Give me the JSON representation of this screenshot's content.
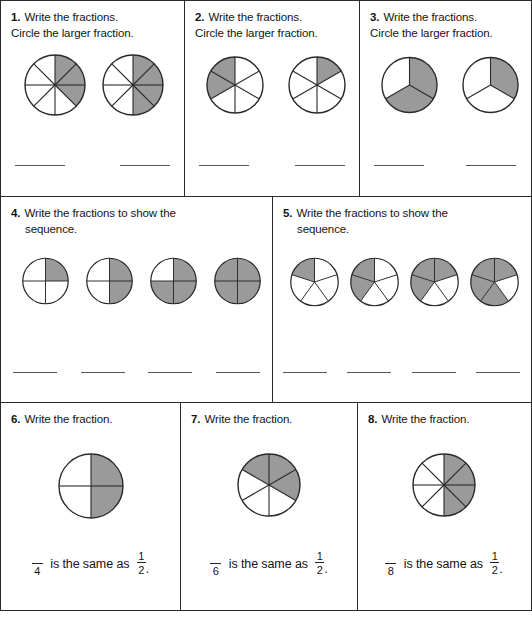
{
  "worksheet": {
    "shade_color": "#9a9a9a",
    "outline_color": "#2a2a2a",
    "line_color": "#555555"
  },
  "problems": [
    {
      "number": "1.",
      "prompt_line1": "Write the fractions.",
      "prompt_line2": "Circle the larger fraction.",
      "figures": [
        {
          "name": "pie-3-of-8",
          "slices": 8,
          "shaded": 3,
          "shaded_indices": [
            0,
            1,
            2
          ],
          "start_angle": -90,
          "radius": 30
        },
        {
          "name": "pie-4-of-8",
          "slices": 8,
          "shaded": 4,
          "shaded_indices": [
            0,
            1,
            2,
            3
          ],
          "start_angle": -90,
          "radius": 30
        }
      ],
      "blanks": 2
    },
    {
      "number": "2.",
      "prompt_line1": "Write the fractions.",
      "prompt_line2": "Circle the larger fraction.",
      "figures": [
        {
          "name": "pie-2-of-6",
          "slices": 6,
          "shaded": 2,
          "shaded_indices": [
            4,
            5
          ],
          "start_angle": -90,
          "radius": 28
        },
        {
          "name": "pie-1-of-6",
          "slices": 6,
          "shaded": 1,
          "shaded_indices": [
            0
          ],
          "start_angle": -90,
          "radius": 28
        }
      ],
      "blanks": 2
    },
    {
      "number": "3.",
      "prompt_line1": "Write the fractions.",
      "prompt_line2": "Circle the larger fraction.",
      "figures": [
        {
          "name": "pie-2-of-3",
          "slices": 3,
          "shaded": 2,
          "shaded_indices": [
            0,
            1
          ],
          "start_angle": -90,
          "radius": 28
        },
        {
          "name": "pie-1-of-3",
          "slices": 3,
          "shaded": 1,
          "shaded_indices": [
            0
          ],
          "start_angle": -90,
          "radius": 28
        }
      ],
      "blanks": 2
    },
    {
      "number": "4.",
      "prompt_line1": "Write the fractions to show the",
      "prompt_line2": "sequence.",
      "figures": [
        {
          "name": "pie-1-of-4",
          "slices": 4,
          "shaded": 1,
          "shaded_indices": [
            0
          ],
          "start_angle": -90,
          "radius": 26
        },
        {
          "name": "pie-2-of-4",
          "slices": 4,
          "shaded": 2,
          "shaded_indices": [
            0,
            1
          ],
          "start_angle": -90,
          "radius": 26
        },
        {
          "name": "pie-3-of-4",
          "slices": 4,
          "shaded": 3,
          "shaded_indices": [
            0,
            1,
            2
          ],
          "start_angle": -90,
          "radius": 26
        },
        {
          "name": "pie-4-of-4",
          "slices": 4,
          "shaded": 4,
          "shaded_indices": [
            0,
            1,
            2,
            3
          ],
          "start_angle": -90,
          "radius": 26
        }
      ],
      "blanks": 4
    },
    {
      "number": "5.",
      "prompt_line1": "Write the fractions to show the",
      "prompt_line2": "sequence.",
      "figures": [
        {
          "name": "pie-1-of-5",
          "slices": 5,
          "shaded": 1,
          "shaded_indices": [
            4
          ],
          "start_angle": -90,
          "radius": 27
        },
        {
          "name": "pie-2-of-5",
          "slices": 5,
          "shaded": 2,
          "shaded_indices": [
            3,
            4
          ],
          "start_angle": -90,
          "radius": 27
        },
        {
          "name": "pie-3-of-5",
          "slices": 5,
          "shaded": 3,
          "shaded_indices": [
            0,
            3,
            4
          ],
          "start_angle": -90,
          "radius": 27
        },
        {
          "name": "pie-4-of-5",
          "slices": 5,
          "shaded": 4,
          "shaded_indices": [
            0,
            2,
            3,
            4
          ],
          "start_angle": -90,
          "radius": 27
        }
      ],
      "blanks": 4
    },
    {
      "number": "6.",
      "prompt_line1": "Write the fraction.",
      "prompt_line2": "",
      "figures": [
        {
          "name": "pie-2-of-4",
          "slices": 4,
          "shaded": 2,
          "shaded_indices": [
            0,
            1
          ],
          "start_angle": -90,
          "radius": 32
        }
      ],
      "sentence": {
        "denominator": "4",
        "text": " is the same as ",
        "half_numerator": "1",
        "half_denominator": "2",
        "period": "."
      }
    },
    {
      "number": "7.",
      "prompt_line1": "Write the fraction.",
      "prompt_line2": "",
      "figures": [
        {
          "name": "pie-3-of-6",
          "slices": 6,
          "shaded": 3,
          "shaded_indices": [
            0,
            1,
            5
          ],
          "start_angle": -90,
          "radius": 31
        }
      ],
      "sentence": {
        "denominator": "6",
        "text": " is the same as ",
        "half_numerator": "1",
        "half_denominator": "2",
        "period": "."
      }
    },
    {
      "number": "8.",
      "prompt_line1": "Write the fraction.",
      "prompt_line2": "",
      "figures": [
        {
          "name": "pie-4-of-8",
          "slices": 8,
          "shaded": 4,
          "shaded_indices": [
            0,
            1,
            2,
            3
          ],
          "start_angle": -90,
          "radius": 31
        }
      ],
      "sentence": {
        "denominator": "8",
        "text": " is the same as ",
        "half_numerator": "1",
        "half_denominator": "2",
        "period": "."
      }
    }
  ]
}
